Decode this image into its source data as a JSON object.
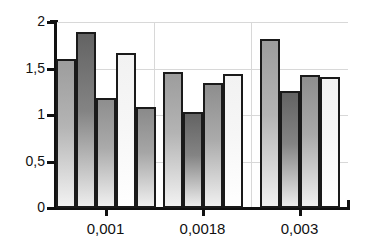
{
  "chart_data": {
    "type": "bar",
    "title": "",
    "subtitle": "",
    "xlabel": "",
    "ylabel": "",
    "categories": [
      "0,001",
      "0,0018",
      "0,003"
    ],
    "ylim": [
      0,
      2
    ],
    "y_ticks": [
      0,
      0.5,
      1,
      1.5,
      2
    ],
    "y_tick_labels": [
      "0",
      "0,5",
      "1",
      "1,5",
      "2"
    ],
    "grid": "horizontal-and-vertical",
    "legend": "none",
    "decimal_separator": "comma",
    "groups": [
      {
        "category": "0,001",
        "bar_count": 5,
        "values": [
          1.6,
          1.89,
          1.18,
          1.67,
          1.09
        ]
      },
      {
        "category": "0,0018",
        "bar_count": 4,
        "values": [
          1.46,
          1.03,
          1.34,
          1.44
        ]
      },
      {
        "category": "0,003",
        "bar_count": 4,
        "values": [
          1.82,
          1.26,
          1.43,
          1.41
        ]
      }
    ],
    "series": [
      {
        "name": "series-1",
        "values": [
          1.6,
          1.46,
          1.82
        ]
      },
      {
        "name": "series-2",
        "values": [
          1.89,
          1.03,
          1.26
        ]
      },
      {
        "name": "series-3",
        "values": [
          1.18,
          1.34,
          1.43
        ]
      },
      {
        "name": "series-4",
        "values": [
          1.67,
          1.44,
          1.41
        ]
      },
      {
        "name": "series-5",
        "values": [
          1.09,
          null,
          null
        ]
      }
    ],
    "colors": {
      "bar_outline": "#1a1a1a",
      "axis": "#111111",
      "gridline": "#d8d8d8",
      "background": "#ffffff"
    }
  }
}
